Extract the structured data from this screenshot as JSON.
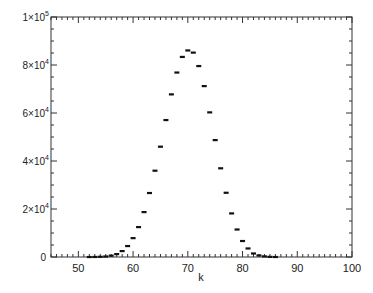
{
  "chart_data": {
    "type": "scatter",
    "title": "",
    "xlabel": "k",
    "ylabel": "",
    "xlim": [
      45,
      100
    ],
    "ylim": [
      0,
      100000
    ],
    "grid": false,
    "legend": null,
    "marker": "horizontal-dash",
    "x_ticks": [
      50,
      60,
      70,
      80,
      90,
      100
    ],
    "x_tick_labels": [
      "50",
      "60",
      "70",
      "80",
      "90",
      "100"
    ],
    "x_minor_step": 1,
    "y_ticks": [
      0,
      20000,
      40000,
      60000,
      80000,
      100000
    ],
    "y_tick_labels": [
      {
        "mantissa": "0",
        "exp": ""
      },
      {
        "mantissa": "2×10",
        "exp": "4"
      },
      {
        "mantissa": "4×10",
        "exp": "4"
      },
      {
        "mantissa": "6×10",
        "exp": "4"
      },
      {
        "mantissa": "8×10",
        "exp": "4"
      },
      {
        "mantissa": "1×10",
        "exp": "5"
      }
    ],
    "y_minor_step": 5000,
    "series": [
      {
        "name": "counts",
        "x": [
          52,
          53,
          54,
          55,
          56,
          57,
          58,
          59,
          60,
          61,
          62,
          63,
          64,
          65,
          66,
          67,
          68,
          69,
          70,
          71,
          72,
          73,
          74,
          75,
          76,
          77,
          78,
          79,
          80,
          81,
          82,
          83,
          84,
          85,
          86
        ],
        "values": [
          30,
          60,
          120,
          250,
          600,
          1250,
          2500,
          4600,
          7900,
          12500,
          18750,
          26700,
          36000,
          46000,
          57100,
          67800,
          76900,
          83400,
          86100,
          85200,
          79600,
          71250,
          60300,
          48750,
          37000,
          26800,
          18200,
          11500,
          6700,
          3600,
          1500,
          700,
          300,
          100,
          40
        ]
      }
    ]
  }
}
